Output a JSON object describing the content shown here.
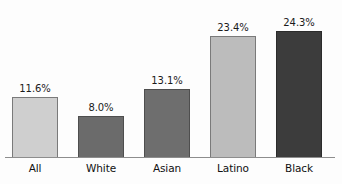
{
  "chart_data": {
    "type": "bar",
    "title": "",
    "subtitle": "",
    "xlabel": "",
    "ylabel": "",
    "categories": [
      "All",
      "White",
      "Asian",
      "Latino",
      "Black"
    ],
    "values": [
      11.6,
      8.0,
      13.1,
      23.4,
      24.3
    ],
    "value_labels": [
      "11.6%",
      "8.0%",
      "13.1%",
      "23.4%",
      "24.3%"
    ],
    "ylim": [
      0,
      26
    ],
    "grid": false,
    "legend": false,
    "legend_position": "none",
    "axis_line": true,
    "bar_colors": [
      "#cfcfcf",
      "#6b6b6b",
      "#6e6e6e",
      "#bcbcbc",
      "#3c3c3c"
    ],
    "bar_border_colors": [
      "#7a7a7a",
      "#4e4e4e",
      "#4e4e4e",
      "#7a7a7a",
      "#2b2b2b"
    ]
  },
  "colors": {
    "background": "#fdfdfd",
    "axis": "#8d8d8d",
    "label_text": "#111111",
    "value_text": "#1b1b1b"
  }
}
